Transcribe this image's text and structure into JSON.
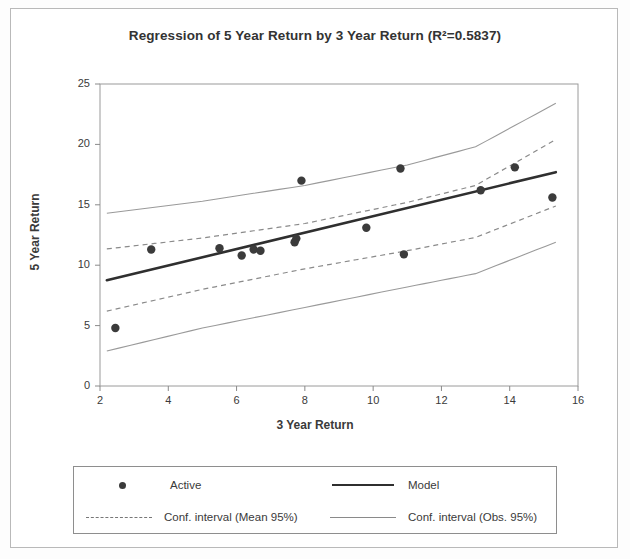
{
  "figure": {
    "title": "Regression of 5 Year Return by 3 Year Return (R²=0.5837)"
  },
  "legend": {
    "items": [
      {
        "label": "Active",
        "key": "marker-dot"
      },
      {
        "label": "Model",
        "key": "line-solid-thick"
      },
      {
        "label": "Conf. interval (Mean 95%)",
        "key": "line-dashed"
      },
      {
        "label": "Conf. interval (Obs. 95%)",
        "key": "line-solid-thin"
      }
    ]
  },
  "chart_data": {
    "type": "scatter",
    "title": "Regression of 5 Year Return by 3 Year Return (R²=0.5837)",
    "xlabel": "3 Year Return",
    "ylabel": "5 Year Return",
    "xlim": [
      2,
      16
    ],
    "ylim": [
      0,
      25
    ],
    "xticks": [
      2,
      4,
      6,
      8,
      10,
      12,
      14,
      16
    ],
    "yticks": [
      0,
      5,
      10,
      15,
      20,
      25
    ],
    "grid": false,
    "legend_position": "bottom",
    "r_squared": 0.5837,
    "series": [
      {
        "name": "Active",
        "type": "scatter",
        "marker": "circle",
        "color": "#3b3b3b",
        "points": [
          {
            "x": 2.45,
            "y": 4.8
          },
          {
            "x": 3.5,
            "y": 11.3
          },
          {
            "x": 5.5,
            "y": 11.4
          },
          {
            "x": 6.15,
            "y": 10.8
          },
          {
            "x": 6.5,
            "y": 11.3
          },
          {
            "x": 6.7,
            "y": 11.2
          },
          {
            "x": 7.7,
            "y": 11.9
          },
          {
            "x": 7.75,
            "y": 12.2
          },
          {
            "x": 7.9,
            "y": 17.0
          },
          {
            "x": 9.8,
            "y": 13.1
          },
          {
            "x": 10.8,
            "y": 18.0
          },
          {
            "x": 10.9,
            "y": 10.9
          },
          {
            "x": 13.15,
            "y": 16.2
          },
          {
            "x": 14.15,
            "y": 18.1
          },
          {
            "x": 15.25,
            "y": 15.6
          }
        ]
      },
      {
        "name": "Model",
        "type": "line",
        "style": "solid-thick",
        "color": "#2f2f2f",
        "x": [
          2.2,
          15.35
        ],
        "y": [
          8.75,
          17.7
        ]
      },
      {
        "name": "Conf. interval (Mean 95%) upper",
        "type": "line",
        "style": "dashed",
        "color": "#8a8a8a",
        "x": [
          2.2,
          5.0,
          8.0,
          11.0,
          13.0,
          15.35
        ],
        "y": [
          11.35,
          12.25,
          13.45,
          15.2,
          16.6,
          20.4
        ]
      },
      {
        "name": "Conf. interval (Mean 95%) lower",
        "type": "line",
        "style": "dashed",
        "color": "#8a8a8a",
        "x": [
          2.2,
          5.0,
          8.0,
          11.0,
          13.0,
          15.35
        ],
        "y": [
          6.2,
          8.0,
          9.7,
          11.2,
          12.3,
          14.9
        ]
      },
      {
        "name": "Conf. interval (Obs. 95%) upper",
        "type": "line",
        "style": "solid-thin",
        "color": "#9a9a9a",
        "x": [
          2.2,
          5.0,
          8.0,
          11.0,
          13.0,
          15.35
        ],
        "y": [
          14.3,
          15.3,
          16.6,
          18.3,
          19.8,
          23.4
        ]
      },
      {
        "name": "Conf. interval (Obs. 95%) lower",
        "type": "line",
        "style": "solid-thin",
        "color": "#9a9a9a",
        "x": [
          2.2,
          5.0,
          8.0,
          11.0,
          13.0,
          15.35
        ],
        "y": [
          2.9,
          4.8,
          6.5,
          8.2,
          9.3,
          11.9
        ]
      }
    ]
  }
}
